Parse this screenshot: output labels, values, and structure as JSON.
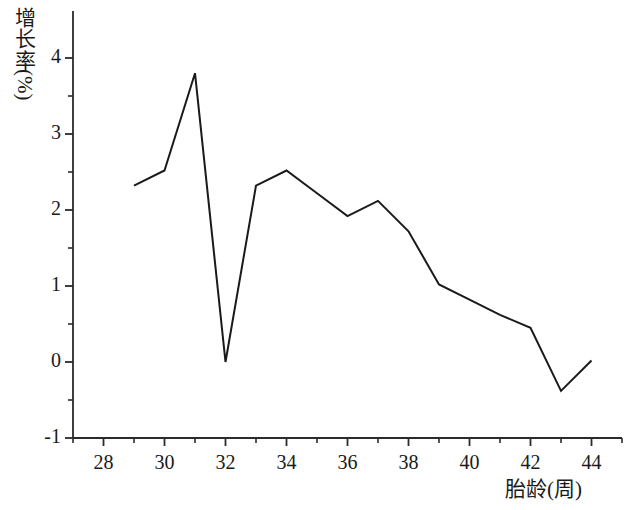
{
  "chart_data": {
    "type": "line",
    "title": "",
    "subtitle": "",
    "xlabel": "胎龄(周)",
    "ylabel": "增长率(%)",
    "ylabel_cjk": "增长率",
    "ylabel_unit": "(%)",
    "xlim": [
      27,
      45
    ],
    "ylim": [
      -1,
      4.45
    ],
    "xticks": [
      28,
      30,
      32,
      34,
      36,
      38,
      40,
      42,
      44
    ],
    "xtick_labels": [
      "28",
      "30",
      "32",
      "34",
      "36",
      "38",
      "40",
      "42",
      "44"
    ],
    "xminor_step": 1,
    "yticks": [
      -1,
      0,
      1,
      2,
      3,
      4
    ],
    "ytick_labels": [
      "-1",
      "0",
      "1",
      "2",
      "3",
      "4"
    ],
    "yminor_step": 0.5,
    "grid": false,
    "legend": false,
    "legend_position": "none",
    "line_color": "#1a1a1a",
    "line_width": 2,
    "markers": false,
    "x": [
      29,
      30,
      31,
      32,
      33,
      34,
      35,
      36,
      37,
      38,
      39,
      40,
      41,
      42,
      43,
      44
    ],
    "series": [
      {
        "name": "增长率",
        "values": [
          2.32,
          2.52,
          3.8,
          0.0,
          2.32,
          2.52,
          2.22,
          1.92,
          2.12,
          1.72,
          1.02,
          0.82,
          0.62,
          0.45,
          -0.38,
          0.02
        ]
      }
    ]
  }
}
